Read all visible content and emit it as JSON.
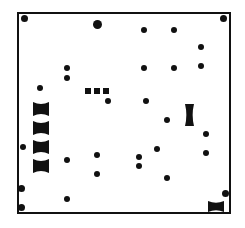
{
  "diagram": {
    "frame": {
      "x": 17,
      "y": 12,
      "w": 214,
      "h": 202,
      "color": "#111111"
    },
    "dots": [
      {
        "x": 24,
        "y": 18,
        "r": 3.5
      },
      {
        "x": 97,
        "y": 24,
        "r": 4.5
      },
      {
        "x": 144,
        "y": 30,
        "r": 3
      },
      {
        "x": 174,
        "y": 30,
        "r": 3
      },
      {
        "x": 223,
        "y": 18,
        "r": 3.5
      },
      {
        "x": 201,
        "y": 47,
        "r": 3
      },
      {
        "x": 67,
        "y": 68,
        "r": 3
      },
      {
        "x": 144,
        "y": 68,
        "r": 3
      },
      {
        "x": 174,
        "y": 68,
        "r": 3
      },
      {
        "x": 201,
        "y": 66,
        "r": 3
      },
      {
        "x": 67,
        "y": 78,
        "r": 3
      },
      {
        "x": 40,
        "y": 88,
        "r": 3
      },
      {
        "x": 108,
        "y": 101,
        "r": 3
      },
      {
        "x": 146,
        "y": 101,
        "r": 3
      },
      {
        "x": 167,
        "y": 120,
        "r": 3
      },
      {
        "x": 206,
        "y": 134,
        "r": 3
      },
      {
        "x": 23,
        "y": 147,
        "r": 3
      },
      {
        "x": 157,
        "y": 149,
        "r": 3
      },
      {
        "x": 97,
        "y": 155,
        "r": 3
      },
      {
        "x": 139,
        "y": 157,
        "r": 3
      },
      {
        "x": 206,
        "y": 153,
        "r": 3
      },
      {
        "x": 67,
        "y": 160,
        "r": 3
      },
      {
        "x": 139,
        "y": 166,
        "r": 3
      },
      {
        "x": 97,
        "y": 174,
        "r": 3
      },
      {
        "x": 167,
        "y": 178,
        "r": 3
      },
      {
        "x": 21,
        "y": 188,
        "r": 3.5
      },
      {
        "x": 225,
        "y": 193,
        "r": 3.5
      },
      {
        "x": 67,
        "y": 199,
        "r": 3
      },
      {
        "x": 21,
        "y": 207,
        "r": 3.5
      }
    ],
    "squares": [
      {
        "x": 85,
        "y": 88,
        "w": 6,
        "h": 6
      },
      {
        "x": 94,
        "y": 88,
        "w": 6,
        "h": 6
      },
      {
        "x": 103,
        "y": 88,
        "w": 6,
        "h": 6
      }
    ],
    "hourglasses": [
      {
        "x": 33,
        "y": 102,
        "w": 16,
        "h": 14,
        "orient": "h"
      },
      {
        "x": 33,
        "y": 121,
        "w": 16,
        "h": 14,
        "orient": "h"
      },
      {
        "x": 33,
        "y": 140,
        "w": 16,
        "h": 14,
        "orient": "h"
      },
      {
        "x": 33,
        "y": 159,
        "w": 16,
        "h": 14,
        "orient": "h"
      },
      {
        "x": 185,
        "y": 104,
        "w": 9,
        "h": 22,
        "orient": "v"
      },
      {
        "x": 208,
        "y": 201,
        "w": 16,
        "h": 11,
        "orient": "h"
      }
    ]
  }
}
